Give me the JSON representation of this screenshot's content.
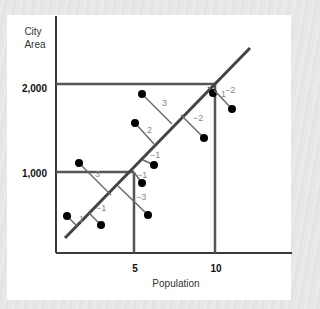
{
  "chart_data": {
    "type": "scatter",
    "title": "",
    "xlabel": "Population",
    "ylabel": "City Area",
    "x_ticks": [
      "5",
      "10"
    ],
    "y_ticks": [
      "1,000",
      "2,000"
    ],
    "grid": false,
    "regression_line": {
      "from": [
        65,
        238
      ],
      "to": [
        250,
        48
      ]
    },
    "reference_lines": [
      {
        "label": "1,000",
        "y_px": 172,
        "x_end_px": 134,
        "x_label": "5"
      },
      {
        "label": "2,000",
        "y_px": 84,
        "x_end_px": 215,
        "x_label": "10"
      }
    ],
    "points": [
      {
        "x_px": 67,
        "y_px": 216,
        "foot": [
          77,
          226
        ],
        "residual": "1",
        "label_pos": [
          79,
          222
        ]
      },
      {
        "x_px": 101,
        "y_px": 225,
        "foot": [
          89,
          213
        ],
        "residual": "−1",
        "label_pos": [
          96,
          211
        ]
      },
      {
        "x_px": 79,
        "y_px": 163,
        "foot": [
          111,
          195
        ],
        "residual": "3",
        "label_pos": [
          95,
          177
        ]
      },
      {
        "x_px": 148,
        "y_px": 215,
        "foot": [
          118,
          186
        ],
        "residual": "−3",
        "label_pos": [
          136,
          200
        ]
      },
      {
        "x_px": 142,
        "y_px": 183,
        "foot": [
          133,
          171
        ],
        "residual": "−1",
        "label_pos": [
          137,
          178
        ]
      },
      {
        "x_px": 154,
        "y_px": 165,
        "foot": [
          143,
          160
        ],
        "residual": "−1",
        "label_pos": [
          150,
          158
        ]
      },
      {
        "x_px": 135,
        "y_px": 123,
        "foot": [
          154,
          144
        ],
        "residual": "2",
        "label_pos": [
          147,
          133
        ]
      },
      {
        "x_px": 142,
        "y_px": 94,
        "foot": [
          172,
          124
        ],
        "residual": "3",
        "label_pos": [
          162,
          106
        ]
      },
      {
        "x_px": 204,
        "y_px": 138,
        "foot": [
          181,
          115
        ],
        "residual": "−2",
        "label_pos": [
          193,
          121
        ]
      },
      {
        "x_px": 213,
        "y_px": 93,
        "foot": [
          208,
          87
        ],
        "residual": "1",
        "label_pos": [
          221,
          97
        ]
      },
      {
        "x_px": 232,
        "y_px": 109,
        "foot": [
          214,
          90
        ],
        "residual": "−2",
        "label_pos": [
          225,
          93
        ]
      }
    ]
  },
  "labels": {
    "y_title_line1": "City",
    "y_title_line2": "Area",
    "y_tick_2000": "2,000",
    "y_tick_1000": "1,000",
    "x_tick_5": "5",
    "x_tick_10": "10",
    "x_title": "Population"
  },
  "colors": {
    "axis": "#3a3a3a",
    "line": "#555555",
    "residual": "#6a6a6a",
    "dot": "#000000",
    "residual_label": "#888888"
  }
}
